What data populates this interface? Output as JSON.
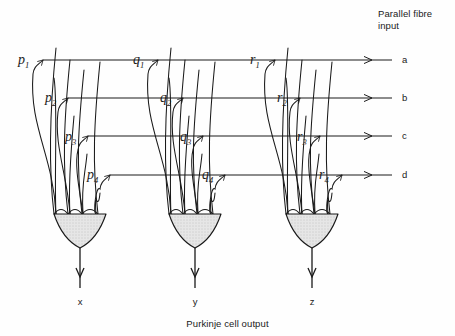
{
  "figure": {
    "title_top": "Parallel fibre\ninput",
    "title_bottom": "Purkinje cell output",
    "background": "#fefefe",
    "ink": "#1a1a1a",
    "soma_fill": "#e0e0e0"
  },
  "parallel_fibres": [
    {
      "id": "a",
      "label": "a",
      "y": 60,
      "x_start": 43,
      "x_end": 392,
      "arrow_x": 372
    },
    {
      "id": "b",
      "label": "b",
      "y": 98,
      "x_start": 68,
      "x_end": 392,
      "arrow_x": 372
    },
    {
      "id": "c",
      "label": "c",
      "y": 136,
      "x_start": 88,
      "x_end": 392,
      "arrow_x": 372
    },
    {
      "id": "d",
      "label": "d",
      "y": 175,
      "x_start": 110,
      "x_end": 392,
      "arrow_x": 372
    }
  ],
  "cells": [
    {
      "name": "cell-x",
      "axon_label": "x",
      "soma_cx": 80,
      "dendrites": [
        {
          "label": "p",
          "sub": "1",
          "fibre": "a",
          "label_x": 18,
          "label_y": 62
        },
        {
          "label": "p",
          "sub": "2",
          "fibre": "b",
          "label_x": 45,
          "label_y": 100
        },
        {
          "label": "p",
          "sub": "3",
          "fibre": "c",
          "label_x": 65,
          "label_y": 139
        },
        {
          "label": "p",
          "sub": "4",
          "fibre": "d",
          "label_x": 87,
          "label_y": 177
        }
      ]
    },
    {
      "name": "cell-y",
      "axon_label": "y",
      "soma_cx": 195,
      "dendrites": [
        {
          "label": "q",
          "sub": "1",
          "fibre": "a",
          "label_x": 133,
          "label_y": 62
        },
        {
          "label": "q",
          "sub": "2",
          "fibre": "b",
          "label_x": 160,
          "label_y": 100
        },
        {
          "label": "q",
          "sub": "3",
          "fibre": "c",
          "label_x": 180,
          "label_y": 139
        },
        {
          "label": "q",
          "sub": "4",
          "fibre": "d",
          "label_x": 202,
          "label_y": 177
        }
      ]
    },
    {
      "name": "cell-z",
      "axon_label": "z",
      "soma_cx": 312,
      "dendrites": [
        {
          "label": "r",
          "sub": "1",
          "fibre": "a",
          "label_x": 250,
          "label_y": 62
        },
        {
          "label": "r",
          "sub": "2",
          "fibre": "b",
          "label_x": 277,
          "label_y": 100
        },
        {
          "label": "r",
          "sub": "3",
          "fibre": "c",
          "label_x": 297,
          "label_y": 139
        },
        {
          "label": "r",
          "sub": "4",
          "fibre": "d",
          "label_x": 319,
          "label_y": 177
        }
      ]
    }
  ],
  "axon_labels": [
    {
      "label": "x",
      "x": 80
    },
    {
      "label": "y",
      "x": 195
    },
    {
      "label": "z",
      "x": 312
    }
  ]
}
